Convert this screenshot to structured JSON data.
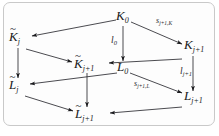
{
  "figure": {
    "type": "commutative-diagram",
    "background_color": "#fdfdfd",
    "border_color": "#c9c9c9",
    "text_color": "#19191c"
  },
  "nodes": [
    {
      "id": "K0",
      "base": "K",
      "tilde": false,
      "subscript": "0",
      "label": "K_0",
      "x": 118,
      "y": 12
    },
    {
      "id": "Ktilde_j",
      "base": "K",
      "tilde": true,
      "subscript": "j",
      "label": "K~_j",
      "x": 7,
      "y": 31
    },
    {
      "id": "Kj1",
      "base": "K",
      "tilde": false,
      "subscript": "j+1",
      "label": "K_{j+1}",
      "x": 180,
      "y": 40
    },
    {
      "id": "Ktilde_j1",
      "base": "K",
      "tilde": true,
      "subscript": "j+1",
      "label": "K~_{j+1}",
      "x": 72,
      "y": 58
    },
    {
      "id": "L0",
      "base": "L",
      "tilde": false,
      "subscript": "0",
      "label": "L_0",
      "x": 117,
      "y": 62
    },
    {
      "id": "Ltilde_j",
      "base": "L",
      "tilde": true,
      "subscript": "j",
      "label": "L~_j",
      "x": 7,
      "y": 79
    },
    {
      "id": "Lj1",
      "base": "L",
      "tilde": false,
      "subscript": "j+1",
      "label": "L_{j+1}",
      "x": 180,
      "y": 91
    },
    {
      "id": "Ltilde_j1",
      "base": "L",
      "tilde": true,
      "subscript": "j+1",
      "label": "L~_{j+1}",
      "x": 73,
      "y": 108
    }
  ],
  "edges": [
    {
      "id": "e1",
      "from": "K0",
      "to": "Ktilde_j",
      "label": ""
    },
    {
      "id": "e2",
      "from": "K0",
      "to": "Kj1",
      "label": "s_{j+1,K}"
    },
    {
      "id": "e3",
      "from": "K0",
      "to": "L0",
      "label": "l_0"
    },
    {
      "id": "e4",
      "from": "Ktilde_j",
      "to": "Ktilde_j1",
      "label": ""
    },
    {
      "id": "e5",
      "from": "Ktilde_j",
      "to": "Ltilde_j",
      "label": ""
    },
    {
      "id": "e6",
      "from": "Kj1",
      "to": "Ktilde_j1",
      "label": ""
    },
    {
      "id": "e7",
      "from": "Kj1",
      "to": "Lj1",
      "label": "l_{j+1}"
    },
    {
      "id": "e8",
      "from": "L0",
      "to": "Ltilde_j",
      "label": ""
    },
    {
      "id": "e9",
      "from": "L0",
      "to": "Lj1",
      "label": "s_{j+1,L}"
    },
    {
      "id": "e10",
      "from": "Ktilde_j1",
      "to": "Ltilde_j1",
      "label": ""
    },
    {
      "id": "e11",
      "from": "Ltilde_j",
      "to": "Ltilde_j1",
      "label": ""
    },
    {
      "id": "e12",
      "from": "Lj1",
      "to": "Ltilde_j1",
      "label": ""
    }
  ],
  "labels": {
    "K0": {
      "base": "K",
      "sub": "0"
    },
    "Ktilde_j": {
      "base": "K",
      "sub": "j",
      "tilde": "~"
    },
    "Kj1": {
      "base": "K",
      "sub": "j+1"
    },
    "Ktilde_j1": {
      "base": "K",
      "sub": "j+1",
      "tilde": "~"
    },
    "L0": {
      "base": "L",
      "sub": "0"
    },
    "Ltilde_j": {
      "base": "L",
      "sub": "j",
      "tilde": "~"
    },
    "Lj1": {
      "base": "L",
      "sub": "j+1"
    },
    "Ltilde_j1": {
      "base": "L",
      "sub": "j+1",
      "tilde": "~"
    }
  },
  "edge_labels": {
    "s_jp1_K": {
      "base": "s",
      "sub": "j+1,K"
    },
    "l_0": {
      "base": "l",
      "sub": "0"
    },
    "l_jp1": {
      "base": "l",
      "sub": "j+1"
    },
    "s_jp1_L": {
      "base": "s",
      "sub": "j+1,L"
    }
  }
}
